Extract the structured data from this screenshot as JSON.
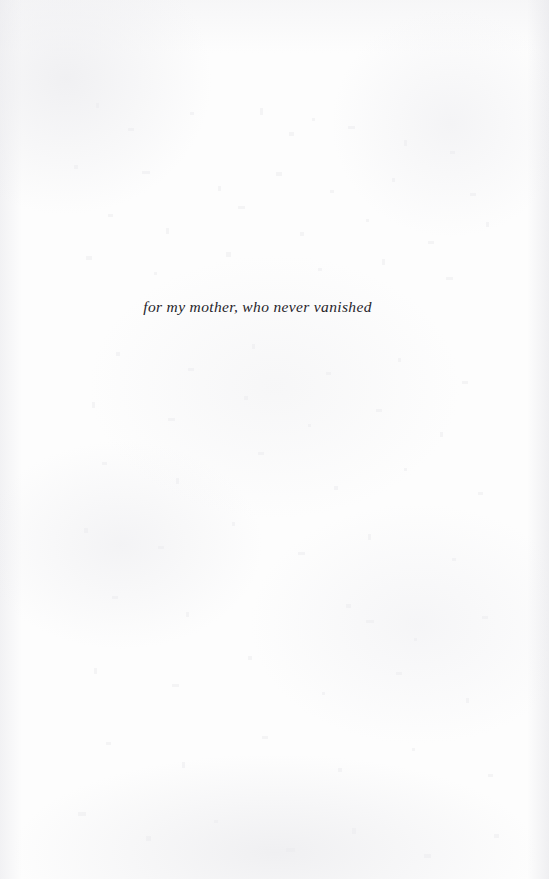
{
  "page": {
    "kind": "book-dedication-page",
    "width": 549,
    "height": 879,
    "paper_color": "#fdfdfd",
    "ink_color": "#26242a"
  },
  "dedication": {
    "text": "for my mother, who never vanished"
  }
}
